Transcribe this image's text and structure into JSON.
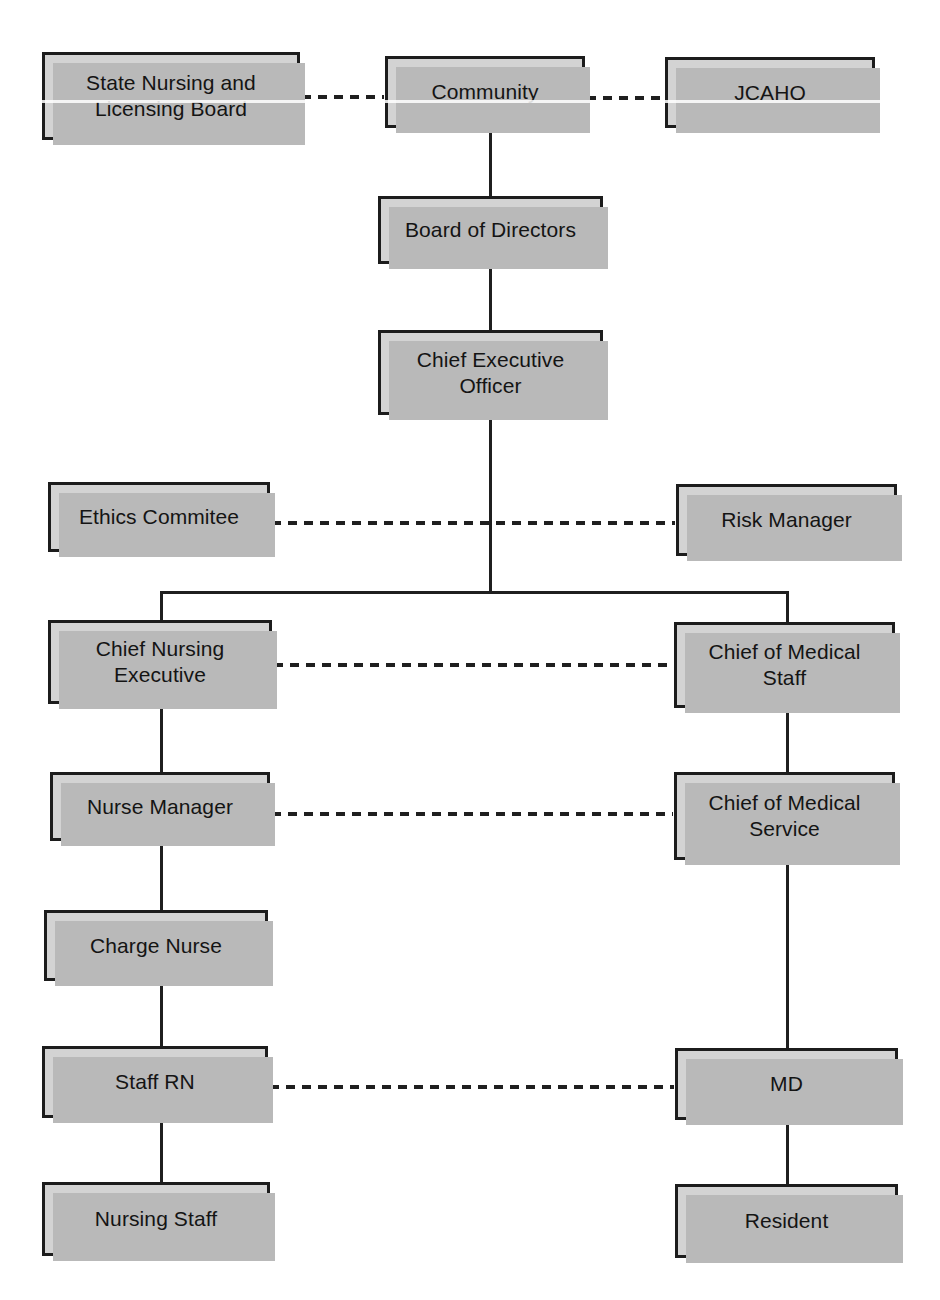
{
  "diagram": {
    "background_color": "#ffffff",
    "box_fill_color": "#d3d3d3",
    "box_border_color": "#1c1c1c",
    "box_shadow_color": "#b9b9b9",
    "connector_color": "#1f1f1f",
    "solid_line_meaning": "direct reporting relationship",
    "dashed_line_meaning": "collaborative / advisory relationship"
  },
  "nodes": [
    {
      "id": "state-nursing-board",
      "label": "State Nursing and\nLicensing Board",
      "x": 42,
      "y": 52,
      "w": 258,
      "h": 88
    },
    {
      "id": "community",
      "label": "Community",
      "x": 385,
      "y": 56,
      "w": 200,
      "h": 72
    },
    {
      "id": "jcaho",
      "label": "JCAHO",
      "x": 665,
      "y": 57,
      "w": 210,
      "h": 71
    },
    {
      "id": "board-of-directors",
      "label": "Board of Directors",
      "x": 378,
      "y": 196,
      "w": 225,
      "h": 68
    },
    {
      "id": "chief-executive-officer",
      "label": "Chief Executive\nOfficer",
      "x": 378,
      "y": 330,
      "w": 225,
      "h": 85
    },
    {
      "id": "ethics-committee",
      "label": "Ethics Commitee",
      "x": 48,
      "y": 482,
      "w": 222,
      "h": 70
    },
    {
      "id": "risk-manager",
      "label": "Risk Manager",
      "x": 676,
      "y": 484,
      "w": 221,
      "h": 72
    },
    {
      "id": "chief-nursing-executive",
      "label": "Chief Nursing\nExecutive",
      "x": 48,
      "y": 620,
      "w": 224,
      "h": 84
    },
    {
      "id": "chief-of-medical-staff",
      "label": "Chief of Medical\nStaff",
      "x": 674,
      "y": 622,
      "w": 221,
      "h": 86
    },
    {
      "id": "nurse-manager",
      "label": "Nurse Manager",
      "x": 50,
      "y": 772,
      "w": 220,
      "h": 69
    },
    {
      "id": "chief-of-medical-service",
      "label": "Chief of Medical\nService",
      "x": 674,
      "y": 772,
      "w": 221,
      "h": 88
    },
    {
      "id": "charge-nurse",
      "label": "Charge Nurse",
      "x": 44,
      "y": 910,
      "w": 224,
      "h": 71
    },
    {
      "id": "staff-rn",
      "label": "Staff RN",
      "x": 42,
      "y": 1046,
      "w": 226,
      "h": 72
    },
    {
      "id": "md",
      "label": "MD",
      "x": 675,
      "y": 1048,
      "w": 223,
      "h": 72
    },
    {
      "id": "nursing-staff",
      "label": "Nursing Staff",
      "x": 42,
      "y": 1182,
      "w": 228,
      "h": 74
    },
    {
      "id": "resident",
      "label": "Resident",
      "x": 675,
      "y": 1184,
      "w": 223,
      "h": 74
    }
  ],
  "solid_connectors": [
    {
      "id": "community-to-board",
      "orient": "v",
      "x": 489,
      "y": 128,
      "len": 68
    },
    {
      "id": "board-to-ceo",
      "orient": "v",
      "x": 489,
      "y": 264,
      "len": 66
    },
    {
      "id": "ceo-to-split",
      "orient": "v",
      "x": 489,
      "y": 415,
      "len": 178
    },
    {
      "id": "split-horizontal-bar",
      "orient": "h",
      "x": 160,
      "y": 591,
      "len": 628
    },
    {
      "id": "split-to-chief-nursing",
      "orient": "v",
      "x": 160,
      "y": 591,
      "len": 30
    },
    {
      "id": "split-to-chief-medical-staff",
      "orient": "v",
      "x": 786,
      "y": 591,
      "len": 32
    },
    {
      "id": "cne-to-nurse-manager",
      "orient": "v",
      "x": 160,
      "y": 704,
      "len": 69
    },
    {
      "id": "nurse-manager-to-charge",
      "orient": "v",
      "x": 160,
      "y": 841,
      "len": 70
    },
    {
      "id": "charge-to-staff-rn",
      "orient": "v",
      "x": 160,
      "y": 981,
      "len": 66
    },
    {
      "id": "staff-rn-to-nursing-staff",
      "orient": "v",
      "x": 160,
      "y": 1118,
      "len": 65
    },
    {
      "id": "cms-staff-to-cms-service",
      "orient": "v",
      "x": 786,
      "y": 708,
      "len": 65
    },
    {
      "id": "cms-service-to-md",
      "orient": "v",
      "x": 786,
      "y": 860,
      "len": 189
    },
    {
      "id": "md-to-resident",
      "orient": "v",
      "x": 786,
      "y": 1120,
      "len": 65
    }
  ],
  "dashed_connectors": [
    {
      "id": "state-board-to-community",
      "x": 302,
      "y": 95,
      "len": 82
    },
    {
      "id": "community-to-jcaho",
      "x": 587,
      "y": 96,
      "len": 77
    },
    {
      "id": "ethics-to-risk-manager",
      "x": 272,
      "y": 521,
      "len": 403
    },
    {
      "id": "cne-to-chief-medical-staff",
      "x": 274,
      "y": 663,
      "len": 399
    },
    {
      "id": "nurse-mgr-to-cms-service",
      "x": 272,
      "y": 812,
      "len": 401
    },
    {
      "id": "staff-rn-to-md",
      "x": 270,
      "y": 1085,
      "len": 404
    }
  ],
  "scan_artifacts": [
    {
      "id": "streak-top",
      "y": 100
    }
  ]
}
